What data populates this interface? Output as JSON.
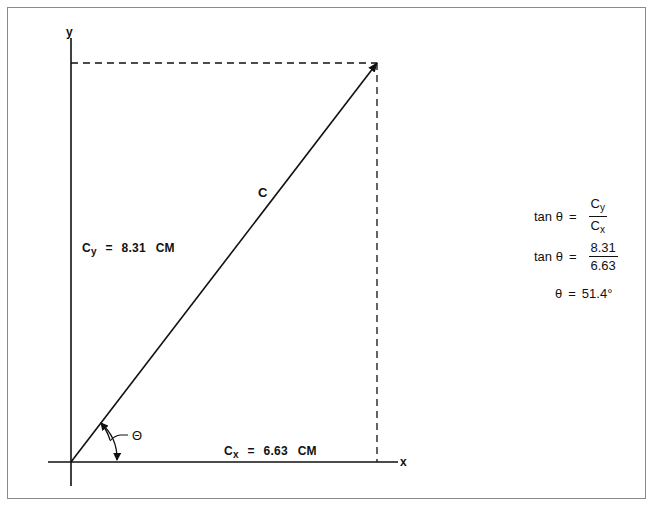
{
  "diagram": {
    "axes": {
      "x_label": "x",
      "y_label": "y"
    },
    "vector": {
      "label": "C"
    },
    "angle": {
      "label": "Θ"
    },
    "components": {
      "cy": {
        "symbol": "C",
        "subscript": "y",
        "equals": "=",
        "value": "8.31",
        "unit": "CM"
      },
      "cx": {
        "symbol": "C",
        "subscript": "x",
        "equals": "=",
        "value": "6.63",
        "unit": "CM"
      }
    },
    "equations": [
      {
        "lhs": "tan θ",
        "eq": "=",
        "num_symbol": "C",
        "num_sub": "y",
        "den_symbol": "C",
        "den_sub": "x"
      },
      {
        "lhs": "tan θ",
        "eq": "=",
        "num": "8.31",
        "den": "6.63"
      },
      {
        "lhs": "θ",
        "eq": "=",
        "rhs": "51.4°"
      }
    ],
    "colors": {
      "line": "#111111",
      "frame": "#8a8a8a",
      "background": "#ffffff"
    }
  }
}
